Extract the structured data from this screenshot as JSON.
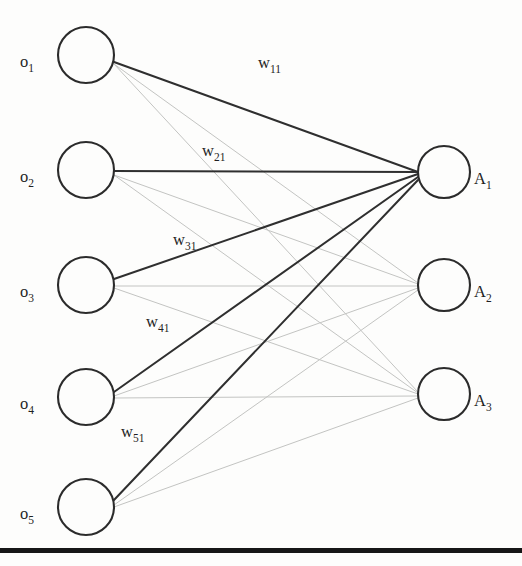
{
  "diagram": {
    "colors": {
      "background": "#fdfdfc",
      "node_stroke": "#2b2b2b",
      "edge_strong": "#2f2f2f",
      "edge_faint": "#c3c4c2",
      "text": "#1f1f1f",
      "footer_rule": "#171717"
    },
    "input_layer": {
      "name": "input-nodes",
      "count": 5,
      "radius": 28,
      "center_x": 86,
      "nodes": [
        {
          "id": "o1",
          "base": "o",
          "sub": "1",
          "cx": 86,
          "cy": 55,
          "label_x": 20,
          "label_y": 67
        },
        {
          "id": "o2",
          "base": "o",
          "sub": "2",
          "cx": 86,
          "cy": 170,
          "label_x": 20,
          "label_y": 182
        },
        {
          "id": "o3",
          "base": "o",
          "sub": "3",
          "cx": 86,
          "cy": 285,
          "label_x": 20,
          "label_y": 297
        },
        {
          "id": "o4",
          "base": "o",
          "sub": "4",
          "cx": 86,
          "cy": 397,
          "label_x": 20,
          "label_y": 409
        },
        {
          "id": "o5",
          "base": "o",
          "sub": "5",
          "cx": 86,
          "cy": 507,
          "label_x": 20,
          "label_y": 519
        }
      ]
    },
    "output_layer": {
      "name": "output-nodes",
      "count": 3,
      "radius": 26,
      "center_x": 444,
      "nodes": [
        {
          "id": "A1",
          "base": "A",
          "sub": "1",
          "cx": 444,
          "cy": 172,
          "label_x": 474,
          "label_y": 184
        },
        {
          "id": "A2",
          "base": "A",
          "sub": "2",
          "cx": 444,
          "cy": 285,
          "label_x": 474,
          "label_y": 297
        },
        {
          "id": "A3",
          "base": "A",
          "sub": "3",
          "cx": 444,
          "cy": 394,
          "label_x": 474,
          "label_y": 406
        }
      ]
    },
    "weight_labels": [
      {
        "id": "w11",
        "base": "w",
        "sub": "11",
        "x": 258,
        "y": 68
      },
      {
        "id": "w21",
        "base": "w",
        "sub": "21",
        "x": 202,
        "y": 156
      },
      {
        "id": "w31",
        "base": "w",
        "sub": "31",
        "x": 173,
        "y": 245
      },
      {
        "id": "w41",
        "base": "w",
        "sub": "41",
        "x": 146,
        "y": 327
      },
      {
        "id": "w51",
        "base": "w",
        "sub": "51",
        "x": 121,
        "y": 437
      }
    ],
    "edges_strong": [
      {
        "from": "o1",
        "to": "A1",
        "x1": 114,
        "y1": 62,
        "x2": 418,
        "y2": 172
      },
      {
        "from": "o2",
        "to": "A1",
        "x1": 114,
        "y1": 171,
        "x2": 418,
        "y2": 172
      },
      {
        "from": "o3",
        "to": "A1",
        "x1": 114,
        "y1": 279,
        "x2": 418,
        "y2": 174
      },
      {
        "from": "o4",
        "to": "A1",
        "x1": 114,
        "y1": 392,
        "x2": 418,
        "y2": 177
      },
      {
        "from": "o5",
        "to": "A1",
        "x1": 114,
        "y1": 500,
        "x2": 418,
        "y2": 180
      }
    ],
    "edges_faint": [
      {
        "from": "o1",
        "to": "A2",
        "x1": 114,
        "y1": 64,
        "x2": 418,
        "y2": 283
      },
      {
        "from": "o1",
        "to": "A3",
        "x1": 114,
        "y1": 64,
        "x2": 418,
        "y2": 392
      },
      {
        "from": "o2",
        "to": "A2",
        "x1": 114,
        "y1": 175,
        "x2": 418,
        "y2": 284
      },
      {
        "from": "o2",
        "to": "A3",
        "x1": 114,
        "y1": 175,
        "x2": 418,
        "y2": 393
      },
      {
        "from": "o3",
        "to": "A2",
        "x1": 114,
        "y1": 286,
        "x2": 418,
        "y2": 286
      },
      {
        "from": "o3",
        "to": "A3",
        "x1": 114,
        "y1": 288,
        "x2": 418,
        "y2": 394
      },
      {
        "from": "o4",
        "to": "A2",
        "x1": 114,
        "y1": 396,
        "x2": 418,
        "y2": 288
      },
      {
        "from": "o4",
        "to": "A3",
        "x1": 114,
        "y1": 398,
        "x2": 418,
        "y2": 396
      },
      {
        "from": "o5",
        "to": "A2",
        "x1": 114,
        "y1": 505,
        "x2": 418,
        "y2": 290
      },
      {
        "from": "o5",
        "to": "A3",
        "x1": 114,
        "y1": 507,
        "x2": 418,
        "y2": 398
      }
    ],
    "footer_rule": {
      "name": "page-rule",
      "x": 0,
      "y": 548,
      "width": 522,
      "height": 5
    }
  }
}
